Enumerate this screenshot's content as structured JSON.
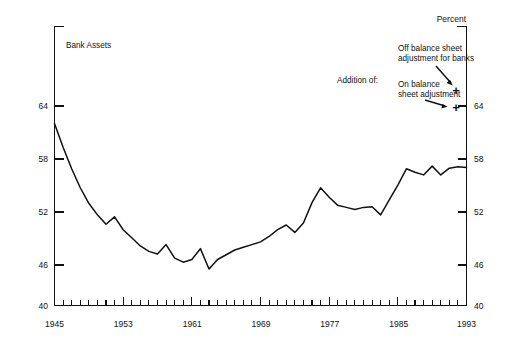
{
  "chart_data": {
    "type": "line",
    "title": "",
    "subtitle": "",
    "xlabel": "",
    "ylabel": "Percent",
    "unit_label": "Percent",
    "series_label": "Bank Assets",
    "xlim": [
      1945,
      1993
    ],
    "ylim": [
      40,
      68
    ],
    "grid": false,
    "legend_position": "inline-annotation",
    "y_ticks": [
      40,
      46,
      52,
      58,
      64
    ],
    "y_tick_labels_left": [
      "40",
      "46",
      "52",
      "58",
      "64"
    ],
    "y_tick_labels_right": [
      "40",
      "46",
      "52",
      "58",
      "64"
    ],
    "x_ticks_labeled": [
      1945,
      1953,
      1961,
      1969,
      1977,
      1985,
      1993
    ],
    "x_tick_labels": [
      "1945",
      "1953",
      "1961",
      "1969",
      "1977",
      "1985",
      "1993"
    ],
    "x_tick_interval_years": 1,
    "series": [
      {
        "name": "Bank Assets",
        "x": [
          1945,
          1946,
          1947,
          1948,
          1949,
          1950,
          1951,
          1952,
          1953,
          1954,
          1955,
          1956,
          1957,
          1958,
          1959,
          1960,
          1961,
          1962,
          1963,
          1964,
          1965,
          1966,
          1967,
          1968,
          1969,
          1970,
          1971,
          1972,
          1973,
          1974,
          1975,
          1976,
          1977,
          1978,
          1979,
          1980,
          1981,
          1982,
          1983,
          1984,
          1985,
          1986,
          1987,
          1988,
          1989,
          1990,
          1991,
          1992,
          1993
        ],
        "values": [
          66.9,
          63.4,
          60.2,
          57.4,
          55.1,
          53.4,
          52.0,
          53.1,
          51.2,
          50.0,
          48.8,
          48.0,
          47.6,
          49.0,
          47.0,
          46.4,
          46.8,
          48.4,
          45.4,
          46.8,
          47.5,
          48.2,
          48.6,
          49.0,
          49.4,
          50.2,
          51.2,
          51.9,
          50.8,
          52.2,
          55.2,
          57.4,
          56.0,
          54.8,
          54.5,
          54.2,
          54.5,
          54.6,
          53.4,
          55.6,
          57.8,
          60.2,
          59.7,
          59.3,
          60.6,
          59.3,
          60.3,
          60.5,
          60.4
        ]
      }
    ],
    "annotations": [
      {
        "id": "series-label",
        "text": "Bank Assets",
        "x": 1946.5,
        "y": 67.0
      },
      {
        "id": "addition-of-label",
        "text": "Addition of:",
        "x": 1979,
        "y": 63.0
      },
      {
        "id": "off-balance-sheet-note",
        "text_line1": "Off balance sheet",
        "text_line2": "adjustment for banks",
        "marker": "+",
        "marker_value": 64.0
      },
      {
        "id": "on-balance-sheet-note",
        "text_line1": "On balance",
        "text_line2": "sheet adjustment",
        "marker": "+",
        "marker_value": 62.0
      }
    ]
  },
  "labels": {
    "unit": "Percent",
    "series": "Bank Assets",
    "addition_of": "Addition of:",
    "off_balance_line1": "Off balance sheet",
    "off_balance_line2": "adjustment for banks",
    "on_balance_line1": "On balance",
    "on_balance_line2": "sheet adjustment",
    "plus_off_balance": "+",
    "plus_on_balance": "+"
  },
  "y_axis": {
    "left": {
      "t40": "40",
      "t46": "46",
      "t52": "52",
      "t58": "58",
      "t64": "64"
    },
    "right": {
      "t40": "40",
      "t46": "46",
      "t52": "52",
      "t58": "58",
      "t64": "64"
    }
  },
  "x_axis": {
    "t1945": "1945",
    "t1953": "1953",
    "t1961": "1961",
    "t1969": "1969",
    "t1977": "1977",
    "t1985": "1985",
    "t1993": "1993"
  },
  "colors": {
    "ink": "#111111",
    "background": "#ffffff"
  }
}
